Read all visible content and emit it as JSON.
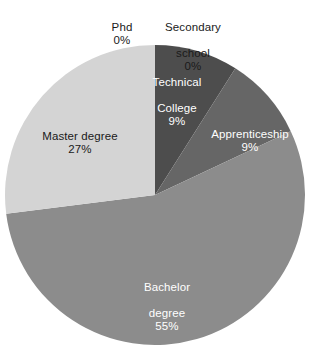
{
  "chart_data": {
    "type": "pie",
    "title": "",
    "subtitle": "",
    "xlabel": "",
    "ylabel": "",
    "grid": false,
    "legend_position": "none",
    "label_format": "category + percent",
    "start_angle_deg": 0,
    "direction": "clockwise",
    "categories": [
      "Secondary school",
      "Technical College",
      "Apprenticeship",
      "Bachelor degree",
      "Master degree",
      "Phd"
    ],
    "values": [
      0,
      9,
      9,
      55,
      27,
      0
    ],
    "value_labels": [
      "0%",
      "9%",
      "9%",
      "55%",
      "27%",
      "0%"
    ],
    "colors": [
      "#4d4d4d",
      "#4d4d4d",
      "#666666",
      "#8c8c8c",
      "#d4d4d4",
      "#d4d4d4"
    ],
    "slices": [
      {
        "name": "secondary-school",
        "label": "Secondary\nschool",
        "label_line1": "Secondary",
        "label_line2": "school",
        "percent_label": "0%",
        "value": 0,
        "color": "#4d4d4d",
        "start_deg": 0,
        "end_deg": 0,
        "label_placement": "outside-top"
      },
      {
        "name": "technical-college",
        "label": "Technical\nCollege",
        "label_line1": "Technical",
        "label_line2": "College",
        "percent_label": "9%",
        "value": 9,
        "color": "#4d4d4d",
        "start_deg": 0,
        "end_deg": 32.4,
        "label_placement": "inside"
      },
      {
        "name": "apprenticeship",
        "label": "Apprenticeship",
        "label_line1": "Apprenticeship",
        "label_line2": "",
        "percent_label": "9%",
        "value": 9,
        "color": "#666666",
        "start_deg": 32.4,
        "end_deg": 64.8,
        "label_placement": "inside"
      },
      {
        "name": "bachelor-degree",
        "label": "Bachelor\ndegree",
        "label_line1": "Bachelor",
        "label_line2": "degree",
        "percent_label": "55%",
        "value": 55,
        "color": "#8c8c8c",
        "start_deg": 64.8,
        "end_deg": 262.8,
        "label_placement": "inside"
      },
      {
        "name": "master-degree",
        "label": "Master degree",
        "label_line1": "Master degree",
        "label_line2": "",
        "percent_label": "27%",
        "value": 27,
        "color": "#d4d4d4",
        "start_deg": 262.8,
        "end_deg": 360,
        "label_placement": "inside"
      },
      {
        "name": "phd",
        "label": "Phd",
        "label_line1": "Phd",
        "label_line2": "",
        "percent_label": "0%",
        "value": 0,
        "color": "#d4d4d4",
        "start_deg": 360,
        "end_deg": 360,
        "label_placement": "outside-top"
      }
    ]
  },
  "labels": {
    "phd": {
      "line1": "Phd",
      "pct": "0%"
    },
    "secondary_school": {
      "line1": "Secondary",
      "line2": "school",
      "pct": "0%"
    },
    "technical_college": {
      "line1": "Technical",
      "line2": "College",
      "pct": "9%"
    },
    "apprenticeship": {
      "line1": "Apprenticeship",
      "pct": "9%"
    },
    "master_degree": {
      "line1": "Master degree",
      "pct": "27%"
    },
    "bachelor_degree": {
      "line1": "Bachelor",
      "line2": "degree",
      "pct": "55%"
    }
  },
  "geometry": {
    "center_x": 155,
    "center_y": 195,
    "radius": 150
  },
  "palette": {
    "background": "#ffffff",
    "technical_college": "#4d4d4d",
    "apprenticeship": "#666666",
    "bachelor_degree": "#8c8c8c",
    "master_degree": "#d4d4d4",
    "text_dark": "#1a1a1a",
    "text_light": "#ffffff"
  }
}
